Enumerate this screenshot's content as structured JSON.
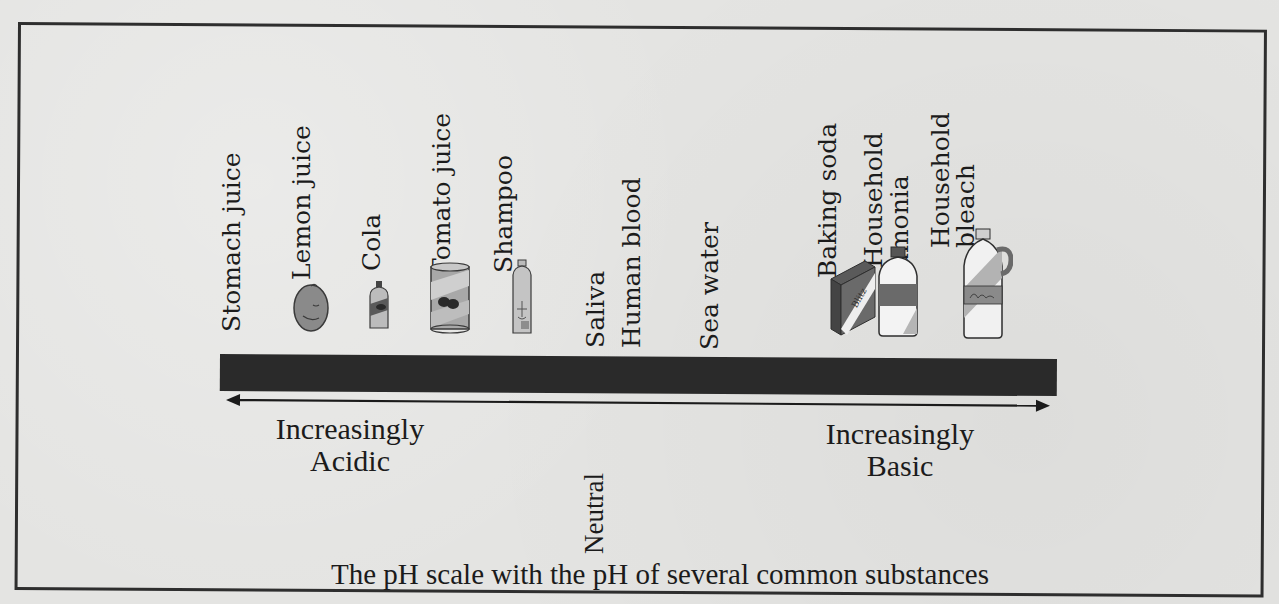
{
  "figure": {
    "caption": "The pH scale with the pH of several common substances",
    "scale_bar_color": "#2a2a2a",
    "acidic_label_line1": "Increasingly",
    "acidic_label_line2": "Acidic",
    "basic_label_line1": "Increasingly",
    "basic_label_line2": "Basic",
    "neutral_label": "Neutral",
    "arrow": "double-headed horizontal arrow beneath scale bar"
  },
  "substances": [
    {
      "label": "Stomach juice",
      "icon": "none",
      "side": "acidic"
    },
    {
      "label": "Lemon juice",
      "icon": "lemon-icon",
      "side": "acidic"
    },
    {
      "label": "Cola",
      "icon": "cola-bottle-icon",
      "side": "acidic"
    },
    {
      "label": "Tomato juice",
      "icon": "tomato-juice-can-icon",
      "side": "acidic"
    },
    {
      "label": "Shampoo",
      "icon": "shampoo-bottle-icon",
      "side": "acidic"
    },
    {
      "label": "Saliva",
      "icon": "none",
      "side": "near-neutral"
    },
    {
      "label": "Human blood",
      "icon": "none",
      "side": "near-neutral"
    },
    {
      "label": "Sea water",
      "icon": "none",
      "side": "basic"
    },
    {
      "label": "Baking soda",
      "icon": "baking-soda-box-icon",
      "side": "basic",
      "box_text": "Blitz"
    },
    {
      "label_line1": "Household",
      "label_line2": "amonia",
      "icon": "ammonia-bottle-icon",
      "side": "basic"
    },
    {
      "label_line1": "Household",
      "label_line2": "bleach",
      "icon": "bleach-jug-icon",
      "side": "basic"
    }
  ]
}
